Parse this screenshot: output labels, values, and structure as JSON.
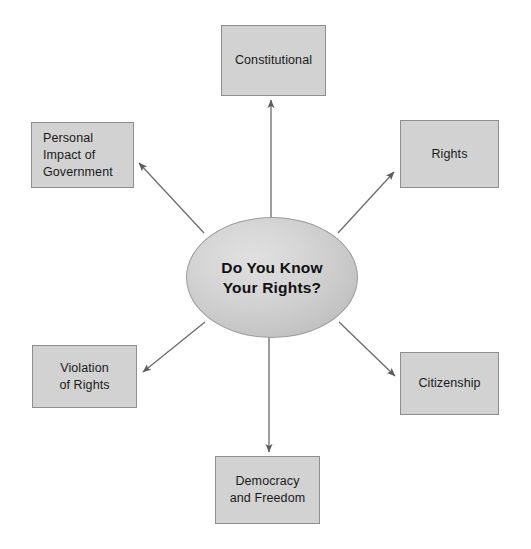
{
  "diagram": {
    "type": "hub-and-spoke concept map",
    "center": {
      "id": "hub",
      "label": "Do You Know\nYour Rights?",
      "shape": "ellipse",
      "fill": "#d2d2d2",
      "stroke": "#9c9c9c"
    },
    "nodes": [
      {
        "id": "constitutional",
        "label": "Constitutional",
        "position": "top",
        "shape": "rectangle",
        "fill": "#d2d2d2",
        "stroke": "#8e8e8e",
        "align": "center"
      },
      {
        "id": "rights",
        "label": "Rights",
        "position": "upper-right",
        "shape": "rectangle",
        "fill": "#d2d2d2",
        "stroke": "#8e8e8e",
        "align": "center"
      },
      {
        "id": "citizenship",
        "label": "Citizenship",
        "position": "lower-right",
        "shape": "rectangle",
        "fill": "#d2d2d2",
        "stroke": "#8e8e8e",
        "align": "center"
      },
      {
        "id": "democracy-and-freedom",
        "label": "Democracy\nand Freedom",
        "position": "bottom",
        "shape": "rectangle",
        "fill": "#d2d2d2",
        "stroke": "#8e8e8e",
        "align": "center"
      },
      {
        "id": "violation-of-rights",
        "label": "Violation\nof Rights",
        "position": "lower-left",
        "shape": "rectangle",
        "fill": "#d2d2d2",
        "stroke": "#8e8e8e",
        "align": "center"
      },
      {
        "id": "personal-impact-of-government",
        "label": "Personal\nImpact of\nGovernment",
        "position": "upper-left",
        "shape": "rectangle",
        "fill": "#d2d2d2",
        "stroke": "#8e8e8e",
        "align": "left"
      }
    ],
    "connectors": [
      {
        "from": "hub",
        "to": "constitutional",
        "style": "single-arrow",
        "color": "#6b6b6b"
      },
      {
        "from": "hub",
        "to": "rights",
        "style": "single-arrow",
        "color": "#6b6b6b"
      },
      {
        "from": "hub",
        "to": "citizenship",
        "style": "single-arrow",
        "color": "#6b6b6b"
      },
      {
        "from": "hub",
        "to": "democracy-and-freedom",
        "style": "single-arrow",
        "color": "#6b6b6b"
      },
      {
        "from": "hub",
        "to": "violation-of-rights",
        "style": "single-arrow",
        "color": "#6b6b6b"
      },
      {
        "from": "hub",
        "to": "personal-impact-of-government",
        "style": "single-arrow",
        "color": "#6b6b6b"
      }
    ],
    "background": "#ffffff"
  }
}
